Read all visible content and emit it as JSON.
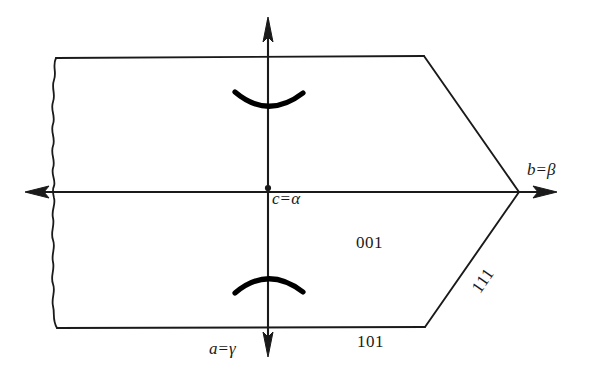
{
  "figure": {
    "type": "crystal-morphology-diagram",
    "background_color": "#ffffff",
    "line_color": "#1a1a1a",
    "labels": {
      "center_point": {
        "var": "c",
        "eq": "=",
        "greek": "α",
        "full": "c = α"
      },
      "right_axis": {
        "var": "b",
        "eq": "=",
        "greek": "β",
        "full": "b = β"
      },
      "bottom_axis": {
        "var": "a",
        "eq": "=",
        "greek": "γ",
        "full": "a = γ"
      }
    },
    "face_indices": [
      {
        "name": "face-001",
        "text": "001"
      },
      {
        "name": "face-101",
        "text": "101"
      },
      {
        "name": "face-111",
        "text": "111"
      }
    ],
    "symmetry_marks": [
      {
        "name": "upper-arc",
        "shape": "arc-opening-up"
      },
      {
        "name": "lower-arc",
        "shape": "arc-opening-down"
      }
    ],
    "axes": [
      {
        "name": "horizontal-axis",
        "arrow_left": true,
        "arrow_right": true
      },
      {
        "name": "vertical-axis",
        "arrow_up": true,
        "arrow_down": true
      }
    ],
    "edges": {
      "left_boundary": "wavy-broken-edge",
      "top_edge": "straight",
      "bottom_edge": "straight",
      "upper_right_edge": "diagonal",
      "lower_right_edge": "diagonal"
    }
  }
}
